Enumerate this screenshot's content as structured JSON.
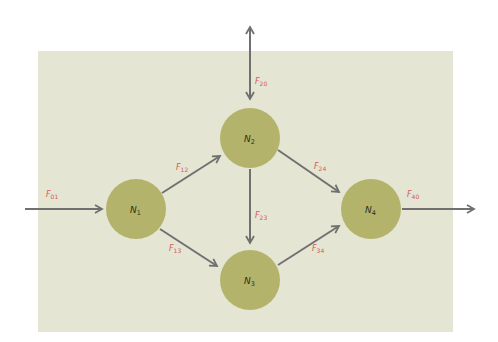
{
  "diagram": {
    "type": "flow-network",
    "colors": {
      "background_panel": "#e5e5d3",
      "node_fill": "#b3b36b",
      "arrow": "#707070",
      "flow_label": "#d25a5a",
      "node_label": "#2f2f1a"
    },
    "nodes": [
      {
        "id": "N1",
        "main": "N",
        "sub": "1",
        "cx": 136,
        "cy": 209,
        "r": 30
      },
      {
        "id": "N2",
        "main": "N",
        "sub": "2",
        "cx": 250,
        "cy": 138,
        "r": 30
      },
      {
        "id": "N3",
        "main": "N",
        "sub": "3",
        "cx": 250,
        "cy": 280,
        "r": 30
      },
      {
        "id": "N4",
        "main": "N",
        "sub": "4",
        "cx": 371,
        "cy": 209,
        "r": 30
      }
    ],
    "flows": [
      {
        "id": "F01",
        "main": "F",
        "sub": "01",
        "from": "source",
        "to": "N1"
      },
      {
        "id": "F12",
        "main": "F",
        "sub": "12",
        "from": "N1",
        "to": "N2"
      },
      {
        "id": "F13",
        "main": "F",
        "sub": "13",
        "from": "N1",
        "to": "N3"
      },
      {
        "id": "F20",
        "main": "F",
        "sub": "20",
        "from": "N2",
        "to": "external",
        "bidirectional": true
      },
      {
        "id": "F23",
        "main": "F",
        "sub": "23",
        "from": "N2",
        "to": "N3"
      },
      {
        "id": "F24",
        "main": "F",
        "sub": "24",
        "from": "N2",
        "to": "N4"
      },
      {
        "id": "F34",
        "main": "F",
        "sub": "34",
        "from": "N3",
        "to": "N4"
      },
      {
        "id": "F40",
        "main": "F",
        "sub": "40",
        "from": "N4",
        "to": "sink"
      }
    ]
  }
}
